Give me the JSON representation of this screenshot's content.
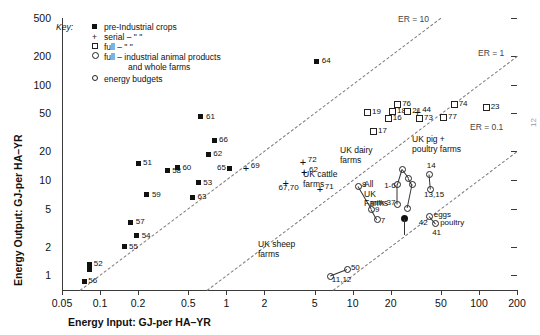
{
  "chart_data": {
    "type": "scatter",
    "title": "",
    "xlabel": "Energy Input: GJ-per HA–YR",
    "ylabel": "Energy Output: GJ-per HA–YR",
    "xscale": "log",
    "yscale": "log",
    "xlim": [
      0.05,
      200
    ],
    "ylim": [
      0.7,
      500
    ],
    "grid": false,
    "xticks": [
      "0.05",
      "0.1",
      "0.2",
      "0.5",
      "1",
      "2",
      "5",
      "10",
      "20",
      "50",
      "100",
      "200"
    ],
    "yticks": [
      "500",
      "200",
      "100",
      "50",
      "20",
      "10",
      "5",
      "2",
      "1"
    ],
    "legend": {
      "position": "top-left",
      "title": "Key:",
      "entries": [
        {
          "marker": "filled-square",
          "label": "pre-Industrial crops"
        },
        {
          "marker": "plus",
          "label": "serial –      \"                \""
        },
        {
          "marker": "open-square",
          "label": "full –        \"                \""
        },
        {
          "marker": "open-circle",
          "label": "full – industrial animal products"
        },
        {
          "marker": "none",
          "label": "and whole farms"
        },
        {
          "marker": "open-circle-small",
          "label": "energy budgets"
        }
      ]
    },
    "reference_lines": [
      {
        "label": "ER = 10",
        "ratio": 10
      },
      {
        "label": "ER = 1",
        "ratio": 1
      },
      {
        "label": "ER = 0.1",
        "ratio": 0.1
      }
    ],
    "series": [
      {
        "name": "pre-Industrial crops",
        "marker": "filled-square",
        "points": [
          {
            "label": "56",
            "x": 0.075,
            "y": 0.85,
            "lx": 4,
            "ly": -4
          },
          {
            "label": "52",
            "x": 0.083,
            "y": 1.3,
            "lx": 4,
            "ly": -3
          },
          {
            "label": "52b",
            "x": 0.083,
            "y": 1.15,
            "lx": 0,
            "ly": 0,
            "nolabel": true
          },
          {
            "label": "55",
            "x": 0.155,
            "y": 2.0,
            "lx": 5,
            "ly": -3
          },
          {
            "label": "54",
            "x": 0.195,
            "y": 2.6,
            "lx": 5,
            "ly": -3
          },
          {
            "label": "57",
            "x": 0.175,
            "y": 3.6,
            "lx": 5,
            "ly": -3
          },
          {
            "label": "59",
            "x": 0.235,
            "y": 7.0,
            "lx": 5,
            "ly": -3
          },
          {
            "label": "51",
            "x": 0.2,
            "y": 15.0,
            "lx": 5,
            "ly": -3
          },
          {
            "label": "58",
            "x": 0.34,
            "y": 12.5,
            "lx": 5,
            "ly": -3
          },
          {
            "label": "60",
            "x": 0.41,
            "y": 13.5,
            "lx": 5,
            "ly": -3
          },
          {
            "label": "63",
            "x": 0.54,
            "y": 6.6,
            "lx": 5,
            "ly": -3
          },
          {
            "label": "53",
            "x": 0.6,
            "y": 9.3,
            "lx": 5,
            "ly": -3
          },
          {
            "label": "62",
            "x": 0.72,
            "y": 18.5,
            "lx": 5,
            "ly": -3
          },
          {
            "label": "66",
            "x": 0.8,
            "y": 26.0,
            "lx": 5,
            "ly": -3
          },
          {
            "label": "61",
            "x": 0.63,
            "y": 46.0,
            "lx": 5,
            "ly": -3
          },
          {
            "label": "65",
            "x": 1.05,
            "y": 13.2,
            "lx": -12,
            "ly": -3
          },
          {
            "label": "64",
            "x": 5.2,
            "y": 175.0,
            "lx": 5,
            "ly": -3
          }
        ]
      },
      {
        "name": "serial crops",
        "marker": "plus",
        "points": [
          {
            "label": "+69",
            "x": 1.45,
            "y": 13.2,
            "lx": 4,
            "ly": -5,
            "plusonly": true
          },
          {
            "label": "+72",
            "x": 4.1,
            "y": 15.5,
            "lx": 4,
            "ly": -5,
            "plusonly": true
          },
          {
            "label": "+62",
            "x": 4.2,
            "y": 12.0,
            "lx": 4,
            "ly": -5,
            "plusonly": true
          },
          {
            "label": "67,70",
            "x": 3.0,
            "y": 9.3,
            "lx": -8,
            "ly": 2
          },
          {
            "label": "+71",
            "x": 5.6,
            "y": 8.0,
            "lx": 4,
            "ly": -5,
            "plusonly": true
          },
          {
            "label": "+44",
            "x": 33.0,
            "y": 52.0,
            "lx": 4,
            "ly": -5,
            "plusonly": true
          }
        ]
      },
      {
        "name": "full industrial crops",
        "marker": "open-square",
        "points": [
          {
            "label": "17",
            "x": 14.5,
            "y": 33.0,
            "lx": 5,
            "ly": -3
          },
          {
            "label": "19",
            "x": 13.0,
            "y": 52.0,
            "lx": 5,
            "ly": -3
          },
          {
            "label": "16",
            "x": 19.0,
            "y": 45.0,
            "lx": 5,
            "ly": -3
          },
          {
            "label": "18",
            "x": 20.5,
            "y": 53.0,
            "lx": 5,
            "ly": -3
          },
          {
            "label": "76",
            "x": 22.5,
            "y": 62.0,
            "lx": 5,
            "ly": -3
          },
          {
            "label": "21",
            "x": 27.0,
            "y": 53.0,
            "lx": 5,
            "ly": -3
          },
          {
            "label": "73",
            "x": 33.5,
            "y": 45.0,
            "lx": 5,
            "ly": -3
          },
          {
            "label": "77",
            "x": 52.0,
            "y": 46.0,
            "lx": 5,
            "ly": -3
          },
          {
            "label": "74",
            "x": 63.0,
            "y": 62.0,
            "lx": 5,
            "ly": -3
          },
          {
            "label": "23",
            "x": 113.0,
            "y": 58.0,
            "lx": 5,
            "ly": -3
          }
        ]
      },
      {
        "name": "UK whole farms and animal products",
        "marker": "open-circle",
        "points": [
          {
            "label": "8",
            "x": 11.0,
            "y": 8.6,
            "lx": 4,
            "ly": -4
          },
          {
            "label": "9",
            "x": 14.0,
            "y": 5.0,
            "lx": 4,
            "ly": -2
          },
          {
            "label": "7",
            "x": 15.5,
            "y": 3.9,
            "lx": 4,
            "ly": -1
          },
          {
            "label": "1-6",
            "x": 22.5,
            "y": 9.0,
            "lx": -13,
            "ly": -1
          },
          {
            "label": "milk 37",
            "x": 22.5,
            "y": 5.6,
            "lx": -27,
            "ly": -4
          },
          {
            "label": "dairy-top",
            "x": 24.5,
            "y": 13.0,
            "nolabel": true
          },
          {
            "label": "dairy-r1",
            "x": 27.5,
            "y": 10.6,
            "nolabel": true
          },
          {
            "label": "dairy-r2",
            "x": 29.5,
            "y": 9.0,
            "nolabel": true
          },
          {
            "label": "dairy-b",
            "x": 27.0,
            "y": 5.1,
            "nolabel": true
          },
          {
            "label": "14",
            "x": 40.0,
            "y": 11.5,
            "lx": -2,
            "ly": -11
          },
          {
            "label": "13,15",
            "x": 41.0,
            "y": 8.0,
            "lx": -6,
            "ly": 3
          },
          {
            "label": "eggs",
            "x": 40.0,
            "y": 4.2,
            "lx": 5,
            "ly": -4
          },
          {
            "label": "poultry",
            "x": 45.0,
            "y": 3.5,
            "lx": 5,
            "ly": -3
          },
          {
            "label": "42",
            "x": 40.0,
            "y": 3.5,
            "lx": -10,
            "ly": -3,
            "nomarker": true
          },
          {
            "label": "41",
            "x": 45.0,
            "y": 3.1,
            "lx": -3,
            "ly": 2,
            "nomarker": true
          },
          {
            "label": "50",
            "x": 9.0,
            "y": 1.15,
            "lx": 4,
            "ly": -4
          },
          {
            "label": "11,12",
            "x": 6.6,
            "y": 0.98,
            "lx": 2,
            "ly": 1
          },
          {
            "label": "All UK Farms",
            "x": 25.5,
            "y": 3.9,
            "marker": "filled-circle",
            "nolabel": true
          }
        ]
      }
    ],
    "annotations": [
      {
        "text": "UK dairy\nfarms",
        "x": 340,
        "y": 146
      },
      {
        "text": "UK cattle\nfarms",
        "x": 303,
        "y": 170
      },
      {
        "text": "All\nUK\nFarms",
        "x": 364,
        "y": 180
      },
      {
        "text": "UK pig +\npoultry farms",
        "x": 412,
        "y": 135
      },
      {
        "text": "UK sheep\nfarms",
        "x": 258,
        "y": 240
      }
    ],
    "page_mark": "12"
  }
}
